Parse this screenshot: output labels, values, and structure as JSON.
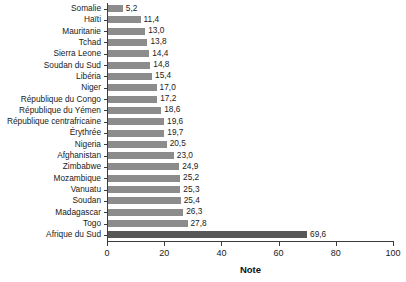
{
  "chart_data": {
    "type": "bar",
    "orientation": "horizontal",
    "title": "",
    "subtitle": "",
    "xlabel": "Note",
    "ylabel": "",
    "xlim": [
      0,
      100
    ],
    "xticks": [
      0,
      20,
      40,
      60,
      80,
      100
    ],
    "xtick_labels": [
      "0",
      "20",
      "40",
      "60",
      "80",
      "100"
    ],
    "grid": false,
    "legend": false,
    "decimal_separator": ",",
    "bar_color": "#8c8c8c",
    "highlight_color": "#575757",
    "categories": [
      "Somalie",
      "Haïti",
      "Mauritanie",
      "Tchad",
      "Sierra Leone",
      "Soudan du Sud",
      "Libéria",
      "Niger",
      "République du Congo",
      "République du Yémen",
      "République centrafricaine",
      "Érythrée",
      "Nigeria",
      "Afghanistan",
      "Zimbabwe",
      "Mozambique",
      "Vanuatu",
      "Soudan",
      "Madagascar",
      "Togo",
      "Afrique du Sud"
    ],
    "values": [
      5.2,
      11.4,
      13.0,
      13.8,
      14.4,
      14.8,
      15.4,
      17.0,
      17.2,
      18.6,
      19.6,
      19.7,
      20.5,
      23.0,
      24.9,
      25.2,
      25.3,
      25.4,
      26.3,
      27.8,
      69.6
    ],
    "value_labels": [
      "5,2",
      "11,4",
      "13,0",
      "13,8",
      "14,4",
      "14,8",
      "15,4",
      "17,0",
      "17,2",
      "18,6",
      "19,6",
      "19,7",
      "20,5",
      "23,0",
      "24,9",
      "25,2",
      "25,3",
      "25,4",
      "26,3",
      "27,8",
      "69,6"
    ],
    "highlight_index": 20
  }
}
